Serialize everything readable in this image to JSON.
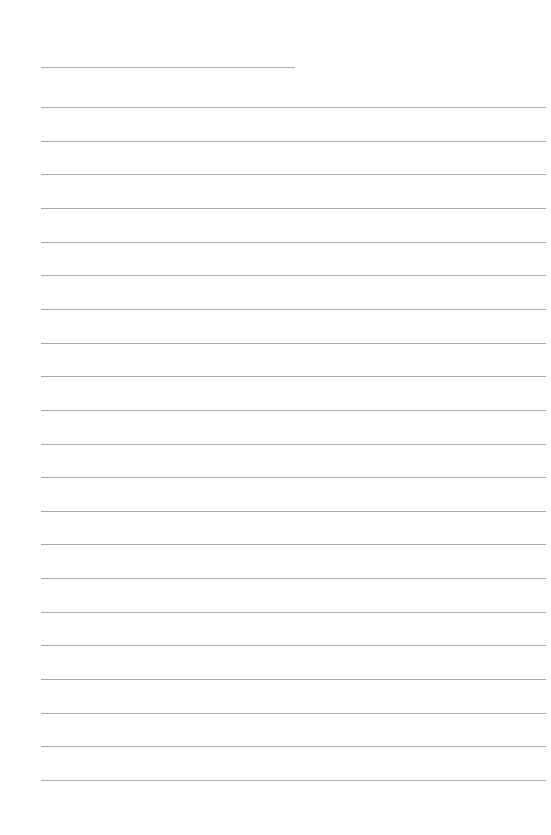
{
  "page": {
    "type": "blank lined page",
    "background_color": "#ffffff",
    "line_color": "#9a9a9a",
    "header_line": {
      "x1": 41,
      "x2": 295,
      "y": 67
    },
    "ruled_lines": {
      "count": 21,
      "x1": 41,
      "x2": 546,
      "first_y": 107,
      "spacing": 33.65
    }
  }
}
